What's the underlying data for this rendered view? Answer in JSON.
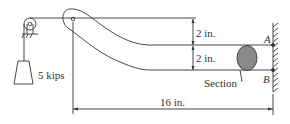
{
  "diagram": {
    "type": "engineering-mechanics-figure",
    "load_label": "5 kips",
    "dimensions": {
      "upper_offset": "2 in.",
      "lower_offset": "2 in.",
      "span": "16 in."
    },
    "section_label": "Section",
    "point_a": "A",
    "point_b": "B",
    "colors": {
      "line": "#333333",
      "section_fill": "#8a8a8a",
      "background": "#ffffff"
    }
  }
}
